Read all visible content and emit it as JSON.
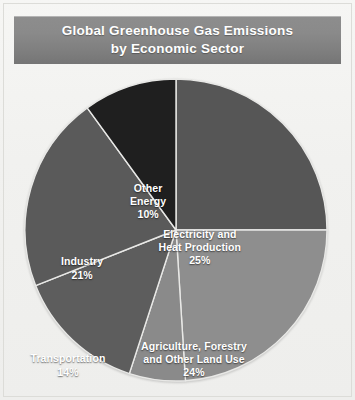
{
  "title": {
    "line1": "Global Greenhouse Gas Emissions",
    "line2": "by Economic Sector"
  },
  "colors": {
    "electricity": "#565656",
    "agriculture": "#8e8e8e",
    "buildings": "#8a8a8a",
    "transportation": "#5d5d5d",
    "industry": "#5a5a5a",
    "other_energy": "#1f1f1f",
    "banner_gradient_top": "#8d8d8d",
    "banner_gradient_bottom": "#757575",
    "label_text": "#ffffff",
    "page_background": "#f2f2f0",
    "frame_border": "#dcdcd8",
    "slice_divider": "#e8e8e6"
  },
  "labels": {
    "electricity": {
      "name_line1": "Electricity and",
      "name_line2": "Heat Production",
      "pct": "25%"
    },
    "agriculture": {
      "name_line1": "Agriculture, Forestry",
      "name_line2": "and Other Land Use",
      "pct": "24%"
    },
    "buildings": {
      "name_line1": "Buildings",
      "pct": "6%"
    },
    "transportation": {
      "name_line1": "Transportation",
      "pct": "14%"
    },
    "industry": {
      "name_line1": "Industry",
      "pct": "21%"
    },
    "other_energy": {
      "name_line1": "Other",
      "name_line2": "Energy",
      "pct": "10%"
    }
  },
  "chart_data": {
    "type": "pie",
    "title": "Global Greenhouse Gas Emissions by Economic Sector",
    "categories": [
      "Electricity and Heat Production",
      "Agriculture, Forestry and Other Land Use",
      "Buildings",
      "Transportation",
      "Industry",
      "Other Energy"
    ],
    "values": [
      25,
      24,
      6,
      14,
      21,
      10
    ],
    "units": "percent",
    "value_labels": [
      "25%",
      "24%",
      "6%",
      "14%",
      "21%",
      "10%"
    ],
    "colors": [
      "#565656",
      "#8e8e8e",
      "#8a8a8a",
      "#5d5d5d",
      "#5a5a5a",
      "#1f1f1f"
    ],
    "start_angle_deg": 0,
    "direction": "clockwise",
    "legend": "none",
    "labels_position": "inside-slice",
    "total": 100
  }
}
